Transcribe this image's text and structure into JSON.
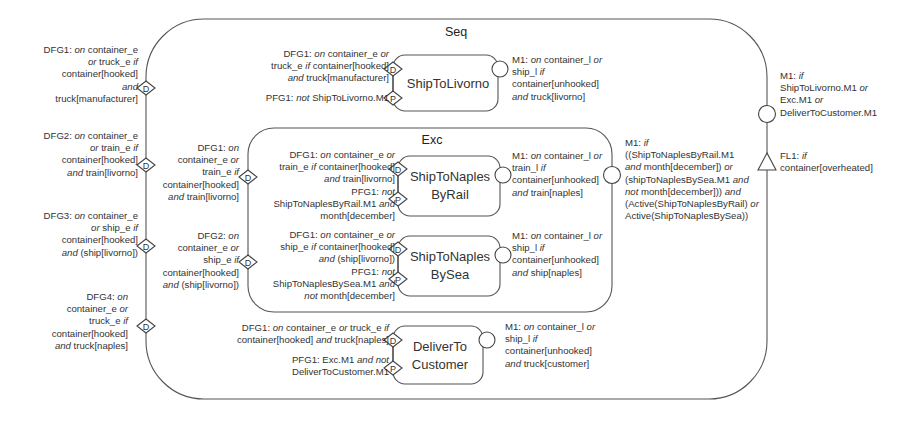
{
  "diagram": {
    "seq": {
      "title": "Seq"
    },
    "exc": {
      "title": "Exc"
    },
    "marker_labels": {
      "data_guard": "D",
      "process_guard": "P"
    },
    "stages": {
      "ship_to_livorno": {
        "lines": [
          "ShipToLivorno"
        ]
      },
      "ship_to_naples_by_rail": {
        "lines": [
          "ShipToNaples",
          "ByRail"
        ]
      },
      "ship_to_naples_by_sea": {
        "lines": [
          "ShipToNaples",
          "BySea"
        ]
      },
      "deliver_to_customer": {
        "lines": [
          "DeliverTo",
          "Customer"
        ]
      }
    },
    "annotations": {
      "seq_dfg1": [
        [
          [
            "DFG1: ",
            false
          ],
          [
            "on",
            true
          ],
          [
            " container_e",
            false
          ]
        ],
        [
          [
            "or",
            true
          ],
          [
            " truck_e ",
            false
          ],
          [
            "if",
            true
          ]
        ],
        [
          [
            "container[hooked]",
            false
          ]
        ],
        [
          [
            "and",
            true
          ]
        ],
        [
          [
            "truck[manufacturer]",
            false
          ]
        ]
      ],
      "seq_dfg2": [
        [
          [
            "DFG2: ",
            false
          ],
          [
            "on",
            true
          ],
          [
            " container_e",
            false
          ]
        ],
        [
          [
            "or",
            true
          ],
          [
            " train_e ",
            false
          ],
          [
            "if",
            true
          ]
        ],
        [
          [
            "container[hooked]",
            false
          ]
        ],
        [
          [
            "and",
            true
          ],
          [
            " train[livorno]",
            false
          ]
        ]
      ],
      "seq_dfg3": [
        [
          [
            "DFG3: ",
            false
          ],
          [
            "on",
            true
          ],
          [
            " container_e",
            false
          ]
        ],
        [
          [
            "or",
            true
          ],
          [
            " ship_e ",
            false
          ],
          [
            "if",
            true
          ]
        ],
        [
          [
            "container[hooked]",
            false
          ]
        ],
        [
          [
            "and",
            true
          ],
          [
            " (ship[livorno])",
            false
          ]
        ]
      ],
      "seq_dfg4": [
        [
          [
            "DFG4: ",
            false
          ],
          [
            "on",
            true
          ]
        ],
        [
          [
            "container_e ",
            false
          ],
          [
            "or",
            true
          ]
        ],
        [
          [
            "truck_e ",
            false
          ],
          [
            "if",
            true
          ]
        ],
        [
          [
            "container[hooked]",
            false
          ]
        ],
        [
          [
            "and",
            true
          ],
          [
            " truck[naples]",
            false
          ]
        ]
      ],
      "exc_dfg1": [
        [
          [
            "DFG1: ",
            false
          ],
          [
            "on",
            true
          ]
        ],
        [
          [
            "container_e ",
            false
          ],
          [
            "or",
            true
          ]
        ],
        [
          [
            "train_e ",
            false
          ],
          [
            "if",
            true
          ]
        ],
        [
          [
            "container[hooked]",
            false
          ]
        ],
        [
          [
            "and",
            true
          ],
          [
            " train[livorno]",
            false
          ]
        ]
      ],
      "exc_dfg2": [
        [
          [
            "DFG2: ",
            false
          ],
          [
            "on",
            true
          ]
        ],
        [
          [
            "container_e ",
            false
          ],
          [
            "or",
            true
          ]
        ],
        [
          [
            "ship_e ",
            false
          ],
          [
            "if",
            true
          ]
        ],
        [
          [
            "container[hooked]",
            false
          ]
        ],
        [
          [
            "and",
            true
          ],
          [
            " (ship[livorno])",
            false
          ]
        ]
      ],
      "livorno_dfg1": [
        [
          [
            "DFG1: ",
            false
          ],
          [
            "on",
            true
          ],
          [
            " container_e ",
            false
          ],
          [
            "or",
            true
          ]
        ],
        [
          [
            "truck_e ",
            false
          ],
          [
            "if",
            true
          ],
          [
            " container[hooked]",
            false
          ]
        ],
        [
          [
            "and",
            true
          ],
          [
            " truck[manufacturer]",
            false
          ]
        ]
      ],
      "livorno_pfg1": [
        [
          [
            "PFG1: ",
            false
          ],
          [
            "not",
            true
          ],
          [
            " ShipToLivorno.M1",
            false
          ]
        ]
      ],
      "livorno_m1": [
        [
          [
            "M1: ",
            false
          ],
          [
            "on",
            true
          ],
          [
            " container_l ",
            false
          ],
          [
            "or",
            true
          ]
        ],
        [
          [
            "ship_l ",
            false
          ],
          [
            "if",
            true
          ]
        ],
        [
          [
            "container[unhooked]",
            false
          ]
        ],
        [
          [
            "and",
            true
          ],
          [
            " truck[livorno]",
            false
          ]
        ]
      ],
      "rail_guards": [
        [
          [
            "DFG1: ",
            false
          ],
          [
            "on",
            true
          ],
          [
            " container_e ",
            false
          ],
          [
            "or",
            true
          ]
        ],
        [
          [
            "train_e ",
            false
          ],
          [
            "if",
            true
          ],
          [
            " container[hooked]",
            false
          ]
        ],
        [
          [
            "and",
            true
          ],
          [
            " train[livorno]",
            false
          ]
        ],
        [
          [
            "PFG1: ",
            false
          ],
          [
            "not",
            true
          ]
        ],
        [
          [
            "ShipToNaplesByRail.M1 ",
            false
          ],
          [
            "and",
            true
          ]
        ],
        [
          [
            "month[december]",
            false
          ]
        ]
      ],
      "rail_m1": [
        [
          [
            "M1: ",
            false
          ],
          [
            "on",
            true
          ],
          [
            " container_l ",
            false
          ],
          [
            "or",
            true
          ]
        ],
        [
          [
            "train_l ",
            false
          ],
          [
            "if",
            true
          ]
        ],
        [
          [
            "container[unhooked]",
            false
          ]
        ],
        [
          [
            "and",
            true
          ],
          [
            " train[naples]",
            false
          ]
        ]
      ],
      "sea_guards": [
        [
          [
            "DFG1: ",
            false
          ],
          [
            "on",
            true
          ],
          [
            " container_e ",
            false
          ],
          [
            "or",
            true
          ]
        ],
        [
          [
            "ship_e ",
            false
          ],
          [
            "if",
            true
          ],
          [
            " container[hooked]",
            false
          ]
        ],
        [
          [
            "and",
            true
          ],
          [
            " (ship[livorno])",
            false
          ]
        ],
        [
          [
            "PFG1: ",
            false
          ],
          [
            "not",
            true
          ]
        ],
        [
          [
            "ShipToNaplesBySea.M1 ",
            false
          ],
          [
            "and",
            true
          ]
        ],
        [
          [
            "not",
            true
          ],
          [
            " month[december]",
            false
          ]
        ]
      ],
      "sea_m1": [
        [
          [
            "M1: ",
            false
          ],
          [
            "on",
            true
          ],
          [
            " container_l ",
            false
          ],
          [
            "or",
            true
          ]
        ],
        [
          [
            "ship_l ",
            false
          ],
          [
            "if",
            true
          ]
        ],
        [
          [
            "container[unhooked]",
            false
          ]
        ],
        [
          [
            "and",
            true
          ],
          [
            " ship[naples]",
            false
          ]
        ]
      ],
      "exc_m1": [
        [
          [
            "M1: ",
            false
          ],
          [
            "if",
            true
          ]
        ],
        [
          [
            "((ShipToNaplesByRail.M1",
            false
          ]
        ],
        [
          [
            "and",
            true
          ],
          [
            " month[december]) ",
            false
          ],
          [
            "or",
            true
          ]
        ],
        [
          [
            "(shipToNaplesBySea.M1 ",
            false
          ],
          [
            "and",
            true
          ]
        ],
        [
          [
            "not",
            true
          ],
          [
            " month[december])) ",
            false
          ],
          [
            "and",
            true
          ]
        ],
        [
          [
            "(Active(ShipToNaplesByRail) ",
            false
          ],
          [
            "or",
            true
          ]
        ],
        [
          [
            "Active(ShipToNaplesBySea))",
            false
          ]
        ]
      ],
      "deliver_dfg1": [
        [
          [
            "DFG1: ",
            false
          ],
          [
            "on",
            true
          ],
          [
            " container_e ",
            false
          ],
          [
            "or",
            true
          ],
          [
            " truck_e ",
            false
          ],
          [
            "if",
            true
          ]
        ],
        [
          [
            "container[hooked] ",
            false
          ],
          [
            "and",
            true
          ],
          [
            " truck[naples]",
            false
          ]
        ]
      ],
      "deliver_pfg1": [
        [
          [
            "PFG1: Exc.M1 ",
            false
          ],
          [
            "and not",
            true
          ]
        ],
        [
          [
            "DeliverToCustomer.M1",
            false
          ]
        ]
      ],
      "deliver_m1": [
        [
          [
            "M1: ",
            false
          ],
          [
            "on",
            true
          ],
          [
            " container_l ",
            false
          ],
          [
            "or",
            true
          ]
        ],
        [
          [
            "ship_l ",
            false
          ],
          [
            "if",
            true
          ]
        ],
        [
          [
            "container[unhooked]",
            false
          ]
        ],
        [
          [
            "and",
            true
          ],
          [
            " truck[customer]",
            false
          ]
        ]
      ],
      "seq_m1": [
        [
          [
            "M1: ",
            false
          ],
          [
            "if",
            true
          ]
        ],
        [
          [
            "ShipToLivorno.M1 ",
            false
          ],
          [
            "or",
            true
          ]
        ],
        [
          [
            "Exc.M1 ",
            false
          ],
          [
            "or",
            true
          ]
        ],
        [
          [
            "DeliverToCustomer.M1",
            false
          ]
        ]
      ],
      "seq_fl1": [
        [
          [
            "FL1: ",
            false
          ],
          [
            "if",
            true
          ]
        ],
        [
          [
            "container[overheated]",
            false
          ]
        ]
      ]
    }
  }
}
